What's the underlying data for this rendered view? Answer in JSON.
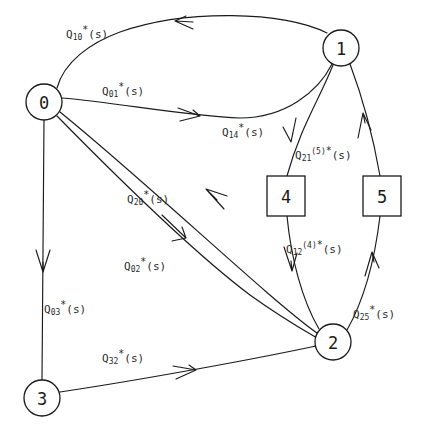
{
  "diagram": {
    "type": "state-transition-graph",
    "nodes": [
      {
        "id": "0",
        "label": "0",
        "shape": "circle",
        "cx": 44,
        "cy": 102,
        "r": 18
      },
      {
        "id": "1",
        "label": "1",
        "shape": "circle",
        "cx": 341,
        "cy": 48,
        "r": 18
      },
      {
        "id": "2",
        "label": "2",
        "shape": "circle",
        "cx": 333,
        "cy": 342,
        "r": 18
      },
      {
        "id": "3",
        "label": "3",
        "shape": "circle",
        "cx": 42,
        "cy": 398,
        "r": 18
      },
      {
        "id": "4",
        "label": "4",
        "shape": "square",
        "x": 267,
        "y": 176,
        "w": 38,
        "h": 40
      },
      {
        "id": "5",
        "label": "5",
        "shape": "square",
        "x": 363,
        "y": 176,
        "w": 38,
        "h": 40
      }
    ],
    "edges": [
      {
        "id": "e10",
        "from": "1",
        "to": "0",
        "base": "Q",
        "sub": "10",
        "sup": "",
        "star": true,
        "tail": "(s)",
        "label_x": 66,
        "label_y": 25
      },
      {
        "id": "e01",
        "from": "0",
        "to": "1",
        "base": "Q",
        "sub": "01",
        "sup": "",
        "star": true,
        "tail": "(s)",
        "label_x": 102,
        "label_y": 82
      },
      {
        "id": "e14",
        "from": "1",
        "to": "4",
        "base": "Q",
        "sub": "14",
        "sup": "",
        "star": true,
        "tail": "(s)",
        "label_x": 222,
        "label_y": 123
      },
      {
        "id": "e21",
        "from": "2",
        "to": "1",
        "base": "Q",
        "sub": "21",
        "sup": "(5)",
        "star": true,
        "tail": "(s)",
        "label_x": 295,
        "label_y": 146
      },
      {
        "id": "e20",
        "from": "2",
        "to": "0",
        "base": "Q",
        "sub": "20",
        "sup": "",
        "star": true,
        "tail": "(s)",
        "label_x": 127,
        "label_y": 190
      },
      {
        "id": "e12",
        "from": "1",
        "to": "2",
        "base": "Q",
        "sub": "12",
        "sup": "(4)",
        "star": true,
        "tail": "(s)",
        "label_x": 286,
        "label_y": 240
      },
      {
        "id": "e02",
        "from": "0",
        "to": "2",
        "base": "Q",
        "sub": "02",
        "sup": "",
        "star": true,
        "tail": "(s)",
        "label_x": 124,
        "label_y": 257
      },
      {
        "id": "e03",
        "from": "0",
        "to": "3",
        "base": "Q",
        "sub": "03",
        "sup": "",
        "star": true,
        "tail": "(s)",
        "label_x": 44,
        "label_y": 300
      },
      {
        "id": "e25",
        "from": "2",
        "to": "5",
        "base": "Q",
        "sub": "25",
        "sup": "",
        "star": true,
        "tail": "(s)",
        "label_x": 353,
        "label_y": 305
      },
      {
        "id": "e32",
        "from": "3",
        "to": "2",
        "base": "Q",
        "sub": "32",
        "sup": "",
        "star": true,
        "tail": "(s)",
        "label_x": 102,
        "label_y": 349
      }
    ],
    "colors": {
      "stroke": "#1a1a1a",
      "background": "#ffffff",
      "text": "#2a2a2a"
    }
  }
}
